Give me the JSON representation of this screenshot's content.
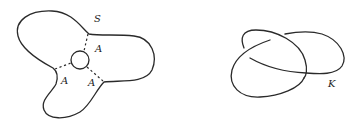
{
  "figure": {
    "left": {
      "description": "Seifert surface with three arms and a central disk",
      "surface_label": "S",
      "arc_labels": [
        "A",
        "A",
        "A"
      ]
    },
    "right": {
      "description": "Knot diagram (trefoil-like)",
      "knot_label": "K"
    }
  }
}
